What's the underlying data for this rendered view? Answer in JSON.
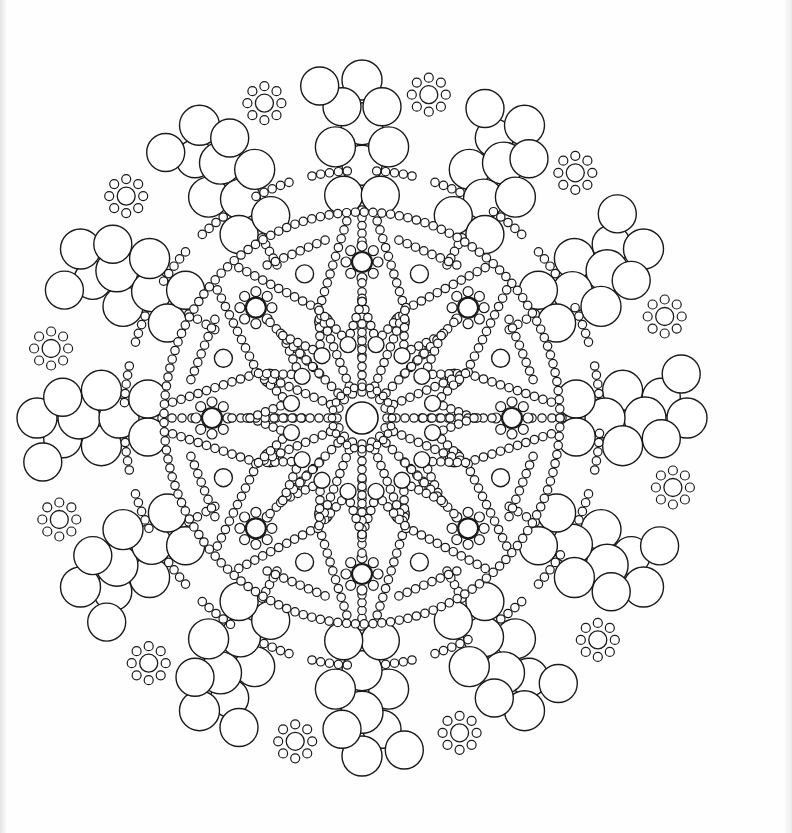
{
  "page": {
    "type": "coloring-page",
    "background": "#fefefe",
    "line_color": "#1a1a1a"
  },
  "mandala": {
    "center": [
      362,
      418
    ],
    "scale_y": 1.04,
    "center_circle_r": 16,
    "symmetry_outer": 12,
    "symmetry_inner": 16,
    "rings": {
      "inner_star_spokes": 16,
      "bead_r": 4.2,
      "medium_circle_r": 9,
      "flower_centers": 8,
      "flower_center_r": 10,
      "outer_big_circle_r": 21,
      "rosette_center_r": 9,
      "rosette_petal_r": 4.5,
      "rosette_petals": 8
    }
  }
}
